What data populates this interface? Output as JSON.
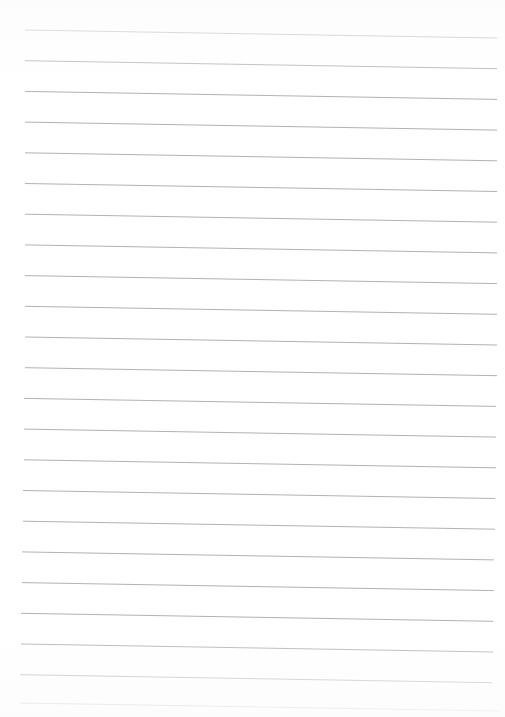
{
  "page": {
    "description": "Blank lined paper scan with no written content",
    "width": 505,
    "height": 717,
    "background_color": "#ffffff",
    "has_text_content": false
  },
  "ruling": {
    "name": "horizontal-ruled-lines",
    "line_color": "#a9a9ae",
    "line_width": 0.9,
    "line_count": 23,
    "spacing_px": 30.7,
    "left_margin_px": 25,
    "right_margin_px": 8,
    "first_line_y_px": 30,
    "tilt_drop_px": 8,
    "orientation": "horizontal",
    "lines": [
      {
        "index": 1,
        "x1": 25,
        "y1": 30.0,
        "x2": 497,
        "y2": 38.0
      },
      {
        "index": 2,
        "x1": 25,
        "y1": 60.7,
        "x2": 497,
        "y2": 68.7
      },
      {
        "index": 3,
        "x1": 25,
        "y1": 91.4,
        "x2": 497,
        "y2": 99.4
      },
      {
        "index": 4,
        "x1": 25,
        "y1": 122.1,
        "x2": 497,
        "y2": 130.1
      },
      {
        "index": 5,
        "x1": 25,
        "y1": 152.8,
        "x2": 497,
        "y2": 160.8
      },
      {
        "index": 6,
        "x1": 25,
        "y1": 183.5,
        "x2": 497,
        "y2": 191.5
      },
      {
        "index": 7,
        "x1": 25,
        "y1": 214.2,
        "x2": 497,
        "y2": 222.2
      },
      {
        "index": 8,
        "x1": 25,
        "y1": 244.9,
        "x2": 497,
        "y2": 252.9
      },
      {
        "index": 9,
        "x1": 25,
        "y1": 275.6,
        "x2": 497,
        "y2": 283.6
      },
      {
        "index": 10,
        "x1": 25,
        "y1": 306.3,
        "x2": 497,
        "y2": 314.3
      },
      {
        "index": 11,
        "x1": 25,
        "y1": 337.0,
        "x2": 497,
        "y2": 345.0
      },
      {
        "index": 12,
        "x1": 25,
        "y1": 367.7,
        "x2": 497,
        "y2": 375.7
      },
      {
        "index": 13,
        "x1": 24,
        "y1": 398.4,
        "x2": 496,
        "y2": 406.4
      },
      {
        "index": 14,
        "x1": 24,
        "y1": 429.1,
        "x2": 496,
        "y2": 437.1
      },
      {
        "index": 15,
        "x1": 24,
        "y1": 459.8,
        "x2": 496,
        "y2": 467.8
      },
      {
        "index": 16,
        "x1": 23,
        "y1": 490.5,
        "x2": 495,
        "y2": 498.5
      },
      {
        "index": 17,
        "x1": 23,
        "y1": 521.2,
        "x2": 495,
        "y2": 529.2
      },
      {
        "index": 18,
        "x1": 22,
        "y1": 551.9,
        "x2": 494,
        "y2": 559.9
      },
      {
        "index": 19,
        "x1": 22,
        "y1": 582.6,
        "x2": 494,
        "y2": 590.6
      },
      {
        "index": 20,
        "x1": 21,
        "y1": 613.3,
        "x2": 493,
        "y2": 621.3
      },
      {
        "index": 21,
        "x1": 21,
        "y1": 644.0,
        "x2": 493,
        "y2": 652.0
      },
      {
        "index": 22,
        "x1": 20,
        "y1": 674.7,
        "x2": 492,
        "y2": 682.7
      },
      {
        "index": 23,
        "x1": 20,
        "y1": 703.0,
        "x2": 500,
        "y2": 711.0
      }
    ]
  }
}
